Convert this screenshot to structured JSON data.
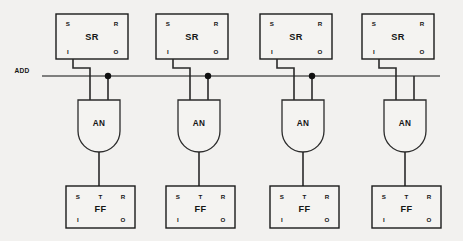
{
  "figure": {
    "background_color": "#f2f1ef",
    "line_color": "#4a4a4a",
    "text_color": "#151515",
    "width": 463,
    "height": 241
  },
  "bus": {
    "label": "ADD",
    "label_x": 22,
    "label_y": 73,
    "y": 76,
    "x_start": 42,
    "x_end": 440
  },
  "labels": {
    "sr_block": "SR",
    "and_gate": "AN",
    "ff_block": "FF",
    "pin_s": "S",
    "pin_r": "R",
    "pin_i": "I",
    "pin_o": "O",
    "pin_t": "T"
  },
  "stages": [
    {
      "index": 1,
      "sr": {
        "x": 56,
        "y": 14,
        "w": 72,
        "h": 45,
        "name": "SR",
        "pins": {
          "tl": "S",
          "tr": "R",
          "bl": "I",
          "br": "O"
        }
      },
      "and": {
        "cx": 99,
        "top": 100,
        "w": 42,
        "h": 52,
        "name": "AN",
        "in_left_x": 90,
        "in_right_x": 108
      },
      "ff": {
        "x": 66,
        "y": 186,
        "w": 69,
        "h": 42,
        "name": "FF",
        "pins": {
          "tl": "S",
          "tc": "T",
          "tr": "R",
          "bl": "I",
          "br": "O"
        }
      },
      "dot": {
        "x": 108,
        "y": 76
      },
      "sr_out_x": 73,
      "jog_x": 90,
      "jog_y": 68
    },
    {
      "index": 2,
      "sr": {
        "x": 156,
        "y": 14,
        "w": 72,
        "h": 45,
        "name": "SR",
        "pins": {
          "tl": "S",
          "tr": "R",
          "bl": "I",
          "br": "O"
        }
      },
      "and": {
        "cx": 199,
        "top": 100,
        "w": 42,
        "h": 52,
        "name": "AN",
        "in_left_x": 190,
        "in_right_x": 208
      },
      "ff": {
        "x": 166,
        "y": 186,
        "w": 69,
        "h": 42,
        "name": "FF",
        "pins": {
          "tl": "S",
          "tc": "T",
          "tr": "R",
          "bl": "I",
          "br": "O"
        }
      },
      "dot": {
        "x": 208,
        "y": 76
      },
      "sr_out_x": 173,
      "jog_x": 190,
      "jog_y": 68
    },
    {
      "index": 3,
      "sr": {
        "x": 260,
        "y": 14,
        "w": 72,
        "h": 45,
        "name": "SR",
        "pins": {
          "tl": "S",
          "tr": "R",
          "bl": "I",
          "br": "O"
        }
      },
      "and": {
        "cx": 303,
        "top": 100,
        "w": 42,
        "h": 52,
        "name": "AN",
        "in_left_x": 294,
        "in_right_x": 312
      },
      "ff": {
        "x": 270,
        "y": 186,
        "w": 69,
        "h": 42,
        "name": "FF",
        "pins": {
          "tl": "S",
          "tc": "T",
          "tr": "R",
          "bl": "I",
          "br": "O"
        }
      },
      "dot": {
        "x": 312,
        "y": 76
      },
      "sr_out_x": 277,
      "jog_x": 294,
      "jog_y": 68
    },
    {
      "index": 4,
      "sr": {
        "x": 362,
        "y": 14,
        "w": 72,
        "h": 45,
        "name": "SR",
        "pins": {
          "tl": "S",
          "tr": "R",
          "bl": "I",
          "br": "O"
        }
      },
      "and": {
        "cx": 405,
        "top": 100,
        "w": 42,
        "h": 52,
        "name": "AN",
        "in_left_x": 396,
        "in_right_x": 414
      },
      "ff": {
        "x": 372,
        "y": 186,
        "w": 69,
        "h": 42,
        "name": "FF",
        "pins": {
          "tl": "S",
          "tc": "T",
          "tr": "R",
          "bl": "I",
          "br": "O"
        }
      },
      "dot": null,
      "sr_out_x": 379,
      "jog_x": 396,
      "jog_y": 68
    }
  ]
}
